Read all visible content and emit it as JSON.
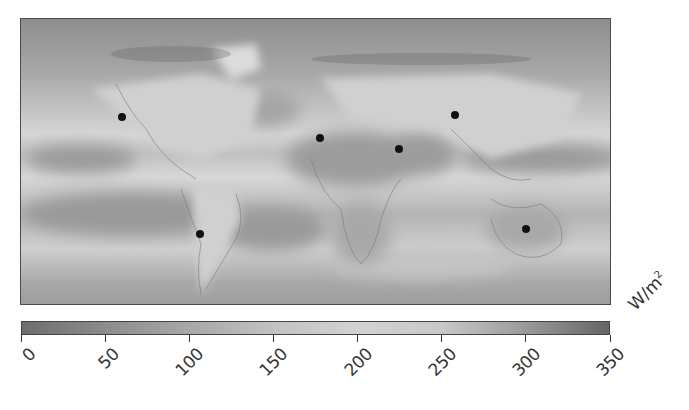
{
  "chart_data": {
    "type": "heatmap",
    "title": "",
    "colorbar": {
      "label": "W/m²",
      "unit_base": "W/m",
      "unit_exp": "2",
      "min": 0,
      "max": 350,
      "ticks": [
        0,
        50,
        100,
        150,
        200,
        250,
        300,
        350
      ],
      "tick_labels": [
        "0",
        "50",
        "100",
        "150",
        "200",
        "250",
        "300",
        "350"
      ],
      "colors": [
        "#6e6e6e",
        "#8c8c8c",
        "#a8a8a8",
        "#c2c2c2",
        "#d2d2d2",
        "#c8c8c8",
        "#9a9a9a",
        "#666666"
      ]
    },
    "markers": [
      {
        "name": "north-america-site",
        "x_px": 121,
        "y_px": 116
      },
      {
        "name": "north-africa-site-west",
        "x_px": 319,
        "y_px": 137
      },
      {
        "name": "north-africa-site-east",
        "x_px": 398,
        "y_px": 148
      },
      {
        "name": "central-asia-site",
        "x_px": 454,
        "y_px": 114
      },
      {
        "name": "south-america-site",
        "x_px": 199,
        "y_px": 233
      },
      {
        "name": "australia-site",
        "x_px": 525,
        "y_px": 228
      }
    ],
    "grid": false,
    "legend_position": "bottom"
  },
  "colorbar": {
    "unit_base": "W/m",
    "unit_exp": "2",
    "ticks": [
      "0",
      "50",
      "100",
      "150",
      "200",
      "250",
      "300",
      "350"
    ]
  }
}
